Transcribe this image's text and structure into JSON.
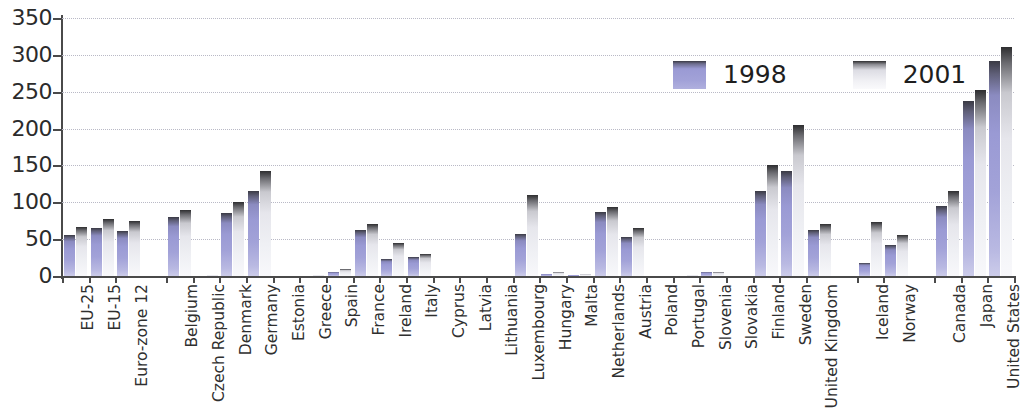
{
  "chart_data": {
    "type": "bar",
    "title": "",
    "xlabel": "",
    "ylabel": "",
    "ylim": [
      0,
      350
    ],
    "yticks": [
      0,
      50,
      100,
      150,
      200,
      250,
      300,
      350
    ],
    "grid": true,
    "legend_position": "top-right",
    "categories": [
      "EU-25",
      "EU-15",
      "Euro-zone 12",
      "Belgium",
      "Czech Republic",
      "Denmark",
      "Germany",
      "Estonia",
      "Greece",
      "Spain",
      "France",
      "Ireland",
      "Italy",
      "Cyprus",
      "Latvia",
      "Lithuania",
      "Luxembourg",
      "Hungary",
      "Malta",
      "Netherlands",
      "Austria",
      "Poland",
      "Portugal",
      "Slovenia",
      "Slovakia",
      "Finland",
      "Sweden",
      "United Kingdom",
      "Iceland",
      "Norway",
      "Canada",
      "Japan",
      "United States"
    ],
    "group_breaks": [
      3,
      28,
      30
    ],
    "series": [
      {
        "name": "1998",
        "color": "#9a9ad4",
        "values": [
          56,
          65,
          61,
          80,
          0,
          85,
          115,
          0,
          0,
          6,
          63,
          23,
          26,
          0,
          0,
          0,
          57,
          3,
          2,
          87,
          53,
          0,
          0,
          5,
          0,
          115,
          143,
          63,
          17,
          42,
          95,
          237,
          292
        ]
      },
      {
        "name": "2001",
        "color": "#eff0f4",
        "values": [
          67,
          77,
          74,
          90,
          1,
          101,
          143,
          0,
          1,
          9,
          71,
          45,
          30,
          0,
          0,
          0,
          110,
          5,
          3,
          93,
          65,
          0,
          1,
          6,
          0,
          150,
          205,
          70,
          73,
          55,
          115,
          253,
          311
        ]
      }
    ]
  },
  "legend": {
    "items": [
      {
        "label": "1998",
        "swatch": "bar-swatch-1998"
      },
      {
        "label": "2001",
        "swatch": "bar-swatch-2001"
      }
    ]
  }
}
